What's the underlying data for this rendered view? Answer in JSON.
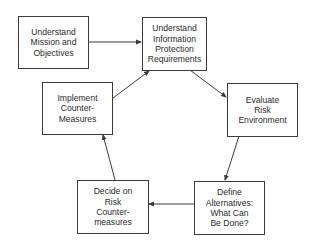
{
  "diagram": {
    "type": "cycle",
    "stroke_color": "#3a3a3a",
    "nodes": [
      {
        "id": "mission",
        "label": "Understand\nMission and\nObjectives"
      },
      {
        "id": "requirements",
        "label": "Understand\nInformation\nProtection\nRequirements"
      },
      {
        "id": "evaluate",
        "label": "Evaluate\nRisk\nEnvironment"
      },
      {
        "id": "alternatives",
        "label": "Define\nAlternatives:\nWhat Can\nBe Done?"
      },
      {
        "id": "decide",
        "label": "Decide on\nRisk\nCounter-\nmeasures"
      },
      {
        "id": "implement",
        "label": "Implement\nCounter-\nMeasures"
      }
    ],
    "edges": [
      {
        "from": "mission",
        "to": "requirements"
      },
      {
        "from": "requirements",
        "to": "evaluate"
      },
      {
        "from": "evaluate",
        "to": "alternatives"
      },
      {
        "from": "alternatives",
        "to": "decide"
      },
      {
        "from": "decide",
        "to": "implement"
      },
      {
        "from": "implement",
        "to": "requirements"
      }
    ]
  }
}
